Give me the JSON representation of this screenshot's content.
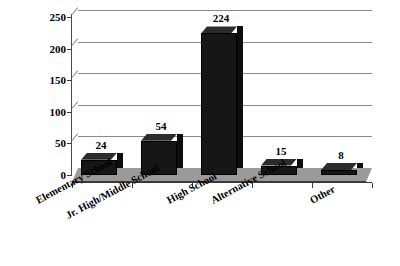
{
  "chart_data": {
    "type": "bar",
    "title": "",
    "subtitle": "",
    "xlabel": "",
    "ylabel": "",
    "categories": [
      "Elementary School",
      "Jr. High/Middle School",
      "High School",
      "Alternative School",
      "Other"
    ],
    "values": [
      24,
      54,
      224,
      15,
      8
    ],
    "value_labels": [
      "24",
      "54",
      "224",
      "15",
      "8"
    ],
    "ylim": [
      0,
      250
    ],
    "yticks": [
      0,
      50,
      100,
      150,
      200,
      250
    ],
    "ytick_labels": [
      "0",
      "50",
      "100",
      "150",
      "200",
      "250"
    ],
    "grid": true,
    "grid_axis": "y",
    "legend": false,
    "legend_position": "none",
    "style": "3d",
    "series": [
      {
        "name": "Count",
        "values": [
          24,
          54,
          224,
          15,
          8
        ],
        "color": "#161616"
      }
    ]
  },
  "colors": {
    "bar_front": "#161616",
    "bar_top": "#2c2c2c",
    "bar_side": "#0d0d0d",
    "floor": "#9a9a9a",
    "gridline": "#8a8a8a",
    "axis": "#3a3a3a",
    "background": "#ffffff",
    "text": "#000000"
  }
}
